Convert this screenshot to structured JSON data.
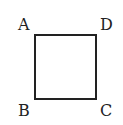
{
  "diagram": {
    "shape": "square",
    "vertices": {
      "top_left": "A",
      "top_right": "D",
      "bottom_left": "B",
      "bottom_right": "C"
    },
    "stroke_color": "#222222"
  }
}
